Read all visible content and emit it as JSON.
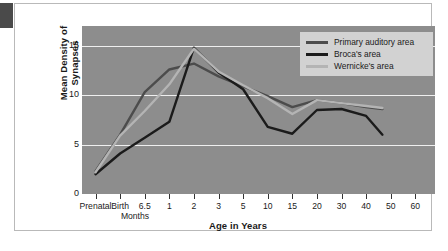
{
  "chart_data": {
    "type": "line",
    "title": "",
    "xlabel": "Age in Years",
    "ylabel": "Mean Density of Synapses",
    "sublabel": "Months",
    "categories": [
      "Prenatal",
      "Birth",
      "6.5",
      "1",
      "2",
      "3",
      "5",
      "10",
      "15",
      "20",
      "30",
      "40",
      "50",
      "60"
    ],
    "ylim": [
      0,
      17
    ],
    "yticks": [
      0,
      5,
      10,
      15
    ],
    "ytick_labels": [
      "0",
      "5",
      "10",
      "15"
    ],
    "grid": "horizontal",
    "legend_position": "top-right",
    "series": [
      {
        "name": "Primary auditory area",
        "color": "#4c4c4c",
        "x": [
          "Prenatal",
          "Birth",
          "6.5",
          "1",
          "2",
          "3",
          "5",
          "10",
          "15",
          "20",
          "30",
          "40",
          "47"
        ],
        "values": [
          2.3,
          6.0,
          10.3,
          12.6,
          13.2,
          11.9,
          10.9,
          9.9,
          8.8,
          9.5,
          9.2,
          8.8,
          8.6
        ]
      },
      {
        "name": "Broca's area",
        "color": "#1b1b1b",
        "x": [
          "Prenatal",
          "Birth",
          "6.5",
          "1",
          "2",
          "3",
          "5",
          "10",
          "15",
          "20",
          "30",
          "40",
          "47"
        ],
        "values": [
          2.0,
          4.1,
          5.7,
          7.3,
          14.8,
          12.3,
          10.6,
          6.8,
          6.1,
          8.5,
          8.6,
          7.9,
          6.0
        ]
      },
      {
        "name": "Wernicke's area",
        "color": "#b4b4b4",
        "x": [
          "Prenatal",
          "Birth",
          "6.5",
          "1",
          "2",
          "3",
          "5",
          "10",
          "15",
          "20",
          "30",
          "40",
          "47"
        ],
        "values": [
          2.2,
          5.9,
          8.4,
          11.1,
          14.7,
          12.4,
          11.0,
          9.7,
          8.1,
          9.5,
          9.2,
          8.9,
          8.7
        ]
      }
    ]
  },
  "legend": {
    "items": [
      {
        "label": "Primary auditory area",
        "color": "#4c4c4c"
      },
      {
        "label": "Broca's area",
        "color": "#1b1b1b"
      },
      {
        "label": "Wernicke's area",
        "color": "#b4b4b4"
      }
    ]
  },
  "axes": {
    "y_title": "Mean Density of Synapses",
    "x_title": "Age in Years",
    "x_sub_note": "Months",
    "y_tick_labels": [
      "15",
      "10",
      "5",
      "0"
    ],
    "x_tick_labels": [
      "Prenatal",
      "Birth",
      "6.5",
      "1",
      "2",
      "3",
      "5",
      "10",
      "15",
      "20",
      "30",
      "40",
      "50",
      "60"
    ]
  },
  "colors": {
    "plot_background": "#8d8d8d",
    "gridline": "#efefef",
    "card_background": "#ffffff",
    "card_border": "#b9b9b9",
    "legend_background": "#d2d2d2",
    "text": "#1a1a1a",
    "corner_block": "#4a4a4a"
  }
}
